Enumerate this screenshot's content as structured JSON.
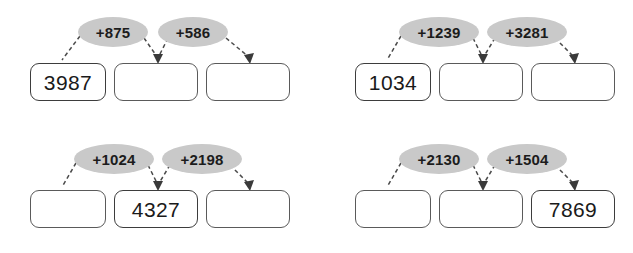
{
  "worksheet": {
    "title": "Number chain addition worksheet",
    "background_color": "#ffffff",
    "box_border_color": "#5a5a5a",
    "bubble_fill_color": "#c9c9c9",
    "arrow_color": "#4a4a4a",
    "text_color": "#1a1a1a"
  },
  "problems": [
    {
      "id": "problem-1",
      "boxes": [
        {
          "value": "3987",
          "filled": true
        },
        {
          "value": "",
          "filled": false
        },
        {
          "value": "",
          "filled": false
        }
      ],
      "operations": [
        {
          "label": "+875",
          "wide": false
        },
        {
          "label": "+586",
          "wide": false
        }
      ]
    },
    {
      "id": "problem-2",
      "boxes": [
        {
          "value": "1034",
          "filled": true
        },
        {
          "value": "",
          "filled": false
        },
        {
          "value": "",
          "filled": false
        }
      ],
      "operations": [
        {
          "label": "+1239",
          "wide": true
        },
        {
          "label": "+3281",
          "wide": true
        }
      ]
    },
    {
      "id": "problem-3",
      "boxes": [
        {
          "value": "",
          "filled": false
        },
        {
          "value": "4327",
          "filled": true
        },
        {
          "value": "",
          "filled": false
        }
      ],
      "operations": [
        {
          "label": "+1024",
          "wide": true
        },
        {
          "label": "+2198",
          "wide": true
        }
      ]
    },
    {
      "id": "problem-4",
      "boxes": [
        {
          "value": "",
          "filled": false
        },
        {
          "value": "",
          "filled": false
        },
        {
          "value": "7869",
          "filled": true
        }
      ],
      "operations": [
        {
          "label": "+2130",
          "wide": true
        },
        {
          "label": "+1504",
          "wide": true
        }
      ]
    }
  ]
}
